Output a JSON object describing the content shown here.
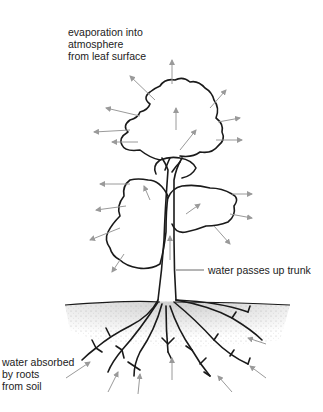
{
  "diagram": {
    "labels": {
      "evaporation": "evaporation into\natmosphere\nfrom leaf surface",
      "trunk": "water passes up trunk",
      "roots": "water absorbed\nby roots\nfrom soil"
    },
    "colors": {
      "outline": "#1a1a1a",
      "arrow": "#9a9a9a",
      "soil": "#bdbdbd",
      "text": "#222222"
    },
    "icons": [
      "evaporation-arrow",
      "absorption-arrow",
      "tree-outline",
      "soil-texture"
    ]
  }
}
